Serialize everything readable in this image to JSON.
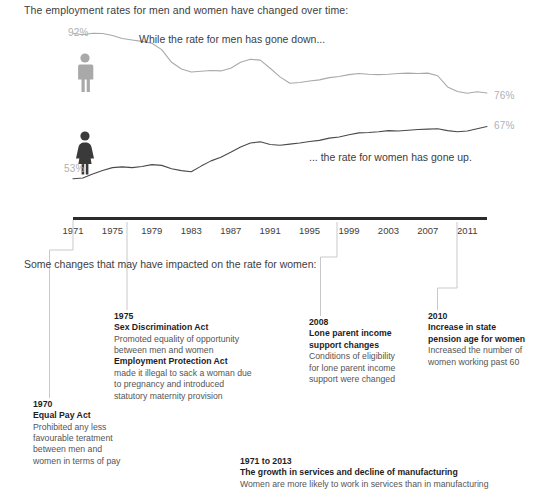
{
  "intro": "The employment rates for men and women have changed over time:",
  "section_label": "Some changes that may have impacted on the rate for women:",
  "captions": {
    "men": "While the rate for men has gone down...",
    "women": "... the rate for women has gone up."
  },
  "labels": {
    "men_start_pct": "92%",
    "men_end_pct": "76%",
    "women_start_pct": "53%",
    "women_end_pct": "67%"
  },
  "colors": {
    "men_line": "#a9a9a9",
    "women_line": "#4a4a4a",
    "men_icon": "#a9a9a9",
    "women_icon": "#3a3a3a",
    "axis": "#2b2b2b",
    "connector": "#c9c9c9",
    "pct_text": "#b0b0b0",
    "body_text": "#4a4a4a",
    "heading_text": "#1d1d1d"
  },
  "axis": {
    "ticks": [
      "1971",
      "1975",
      "1979",
      "1983",
      "1987",
      "1991",
      "1995",
      "1999",
      "2003",
      "2007",
      "2011"
    ]
  },
  "notes": [
    {
      "id": "1970",
      "year": "1970",
      "headings": [
        "Equal Pay Act"
      ],
      "body": [
        "Prohibited any less",
        "favourable teratment",
        "between men and",
        "women in terms of pay"
      ]
    },
    {
      "id": "1975",
      "year": "1975",
      "heading1": "Sex Discrimination Act",
      "body1": [
        "Promoted equality of opportunity",
        "between men and women"
      ],
      "heading2": "Employment Protection Act",
      "body2": [
        "made it illegal to sack a woman due",
        "to pregnancy and introduced",
        "statutory maternity provision"
      ]
    },
    {
      "id": "2008",
      "year": "2008",
      "headings": [
        "Lone parent income",
        "support changes"
      ],
      "body": [
        "Conditions of eligibility",
        "for lone parent income",
        "support were changed"
      ]
    },
    {
      "id": "2010",
      "year": "2010",
      "headings": [
        "Increase in state",
        "pension age for women"
      ],
      "body": [
        "Increased the number of",
        "women working past 60"
      ]
    },
    {
      "id": "growth",
      "year": "1971 to 2013",
      "headings": [
        "The growth in services and decline of manufacturing"
      ],
      "body": [
        "Women are more likely to work in services than in manufacturing"
      ]
    }
  ],
  "chart_data": {
    "type": "line",
    "title": "The employment rates for men and women have changed over time:",
    "xlabel": "",
    "ylabel": "Employment rate (%)",
    "xlim": [
      1971,
      2013
    ],
    "ylim": [
      50,
      95
    ],
    "grid": false,
    "legend": "icons",
    "x": [
      1971,
      1972,
      1973,
      1974,
      1975,
      1976,
      1977,
      1978,
      1979,
      1980,
      1981,
      1982,
      1983,
      1984,
      1985,
      1986,
      1987,
      1988,
      1989,
      1990,
      1991,
      1992,
      1993,
      1994,
      1995,
      1996,
      1997,
      1998,
      1999,
      2000,
      2001,
      2002,
      2003,
      2004,
      2005,
      2006,
      2007,
      2008,
      2009,
      2010,
      2011,
      2012,
      2013
    ],
    "series": [
      {
        "name": "Men",
        "color": "#a9a9a9",
        "start_label": "92%",
        "end_label": "76%",
        "values": [
          92.0,
          91.6,
          92.0,
          91.9,
          91.4,
          90.6,
          90.2,
          89.8,
          89.3,
          87.6,
          84.2,
          82.4,
          81.6,
          81.8,
          82.0,
          81.9,
          82.6,
          84.2,
          85.0,
          84.8,
          82.6,
          80.3,
          78.6,
          78.8,
          79.2,
          79.5,
          80.1,
          80.4,
          80.9,
          81.2,
          81.0,
          80.9,
          81.0,
          81.2,
          81.3,
          81.2,
          81.3,
          80.6,
          77.6,
          76.4,
          75.9,
          76.3,
          76.0
        ]
      },
      {
        "name": "Women",
        "color": "#4a4a4a",
        "start_label": "53%",
        "end_label": "67%",
        "values": [
          53.0,
          53.2,
          54.3,
          55.2,
          56.0,
          56.2,
          56.0,
          56.3,
          56.8,
          56.6,
          55.7,
          55.2,
          54.9,
          56.4,
          57.8,
          58.8,
          60.1,
          61.5,
          62.6,
          62.9,
          62.2,
          62.0,
          62.3,
          62.6,
          63.0,
          63.3,
          63.9,
          64.2,
          64.8,
          65.3,
          65.4,
          65.6,
          65.9,
          65.8,
          66.0,
          66.2,
          66.3,
          66.4,
          65.9,
          65.6,
          65.8,
          66.4,
          67.0
        ]
      }
    ]
  }
}
